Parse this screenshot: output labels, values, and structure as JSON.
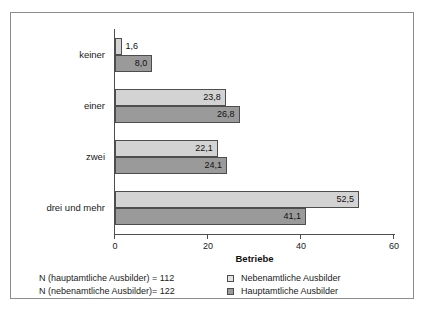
{
  "chart_data": {
    "type": "bar",
    "orientation": "horizontal",
    "title": "",
    "xlabel": "Betriebe",
    "ylabel": "",
    "xlim": [
      0,
      60
    ],
    "xticks": [
      0,
      20,
      40,
      60
    ],
    "xtick_labels": [
      "0",
      "20",
      "40",
      "60"
    ],
    "grid": false,
    "legend_position": "bottom-right",
    "categories": [
      "keiner",
      "einer",
      "zwei",
      "drei und mehr"
    ],
    "series": [
      {
        "name": "Nebenamtliche Ausbilder",
        "color": "#d3d3d3",
        "values": [
          1.6,
          23.8,
          22.1,
          52.5
        ],
        "value_labels": [
          "1,6",
          "23,8",
          "22,1",
          "52,5"
        ]
      },
      {
        "name": "Hauptamtliche Ausbilder",
        "color": "#9a9a9a",
        "values": [
          8.0,
          26.8,
          24.1,
          41.1
        ],
        "value_labels": [
          "8,0",
          "26,8",
          "24,1",
          "41,1"
        ]
      }
    ]
  },
  "footer": {
    "note_1": "N (hauptamtliche Ausbilder) = 112",
    "note_2": "N (nebenamtliche Ausbilder)= 122"
  },
  "legend": {
    "item_1": "Nebenamtliche Ausbilder",
    "item_2": "Hauptamtliche Ausbilder"
  }
}
